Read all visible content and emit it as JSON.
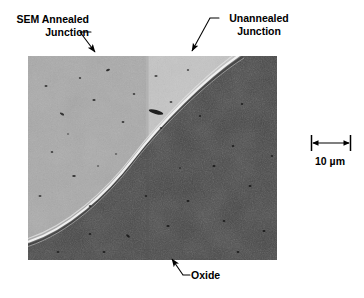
{
  "figure": {
    "type": "sem-micrograph-figure",
    "background_color": "#ffffff",
    "width": 364,
    "height": 298
  },
  "annotations": {
    "sem_annealed": {
      "line1": "SEM Annealed",
      "line2": "Junction",
      "leader": "arrow pointing down-right to annealed junction region"
    },
    "unannealed": {
      "line1": "Unannealed",
      "line2": "Junction",
      "leader": "arrow pointing down-left to unannealed junction region"
    },
    "oxide": {
      "text": "Oxide",
      "leader": "arrow pointing up-left to dark oxide region"
    }
  },
  "scale_bar": {
    "value": "10",
    "unit": "µm",
    "label": "10 µm",
    "length_px": 37
  },
  "micrograph": {
    "regions": [
      {
        "name": "annealed-junction",
        "color": "#ababab",
        "description": "medium gray upper-left silicon region"
      },
      {
        "name": "unannealed-junction",
        "color": "#c6c6c6",
        "description": "lighter gray upper-right silicon region"
      },
      {
        "name": "oxide",
        "color": "#474747",
        "description": "dark gray lower-right oxide region"
      },
      {
        "name": "junction-edge",
        "color": "#f2f2f2",
        "description": "bright white curved boundary line"
      }
    ],
    "seam_x": 120,
    "bounds": {
      "left": 28,
      "top": 56,
      "width": 249,
      "height": 204
    }
  },
  "colors": {
    "ink": "#000000",
    "annealed": "#ababab",
    "unannealed": "#c6c6c6",
    "oxide": "#474747",
    "edge_highlight": "#f2f2f2"
  }
}
